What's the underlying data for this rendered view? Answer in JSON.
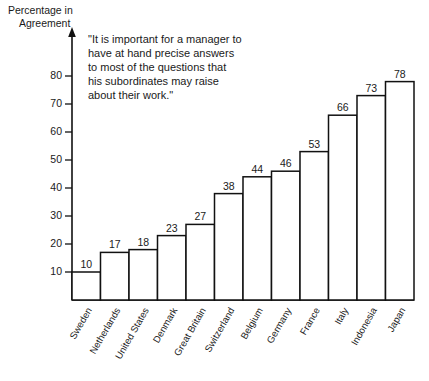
{
  "chart_data": {
    "type": "bar",
    "title": "",
    "subtitle": "",
    "annotation": "\"It is important for a manager to have at hand precise answers to most of the questions that his subordinates may raise about their work.\"",
    "annotation_lines": [
      "\"It is important for a manager to",
      "have at hand precise answers",
      "to most of the questions that",
      "his subordinates may raise",
      "about their work.\""
    ],
    "xlabel": "",
    "ylabel": "Percentage in Agreement",
    "ylabel_lines": [
      "Percentage in",
      "Agreement"
    ],
    "categories": [
      "Sweden",
      "Netherlands",
      "United States",
      "Denmark",
      "Great Britain",
      "Switzerland",
      "Belgium",
      "Germany",
      "France",
      "Italy",
      "Indonesia",
      "Japan"
    ],
    "values": [
      10,
      17,
      18,
      23,
      27,
      38,
      44,
      46,
      53,
      66,
      73,
      78
    ],
    "ylim": [
      0,
      85
    ],
    "yticks": [
      10,
      20,
      30,
      40,
      50,
      60,
      70,
      80
    ],
    "ytick_labels": [
      "10",
      "20",
      "30",
      "40",
      "50",
      "60",
      "70",
      "80"
    ],
    "value_labels": [
      "10",
      "17",
      "18",
      "23",
      "27",
      "38",
      "44",
      "46",
      "53",
      "66",
      "73",
      "78"
    ],
    "grid": false,
    "legend": false,
    "bar_fill_color": "#ffffff",
    "bar_edge_color": "#111111",
    "axis_color": "#111111",
    "background_color": "#ffffff",
    "category_label_rotation_deg": -60
  }
}
